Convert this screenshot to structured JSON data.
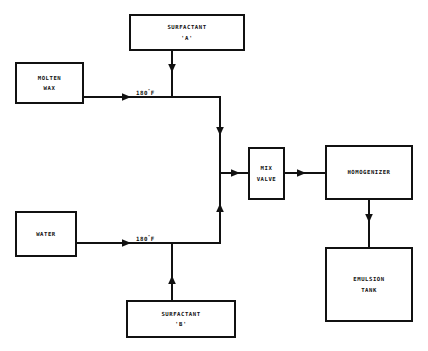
{
  "diagram": {
    "line_color": "#111111",
    "background_color": "#ffffff",
    "nodes": [
      {
        "id": "surfactant_a",
        "label": "SURFACTANT\n'A'"
      },
      {
        "id": "molten_wax",
        "label": "MOLTEN\nWAX"
      },
      {
        "id": "water",
        "label": "WATER"
      },
      {
        "id": "surfactant_b",
        "label": "SURFACTANT\n'B'"
      },
      {
        "id": "mix_valve",
        "label": "MIX\nVALVE"
      },
      {
        "id": "homogenizer",
        "label": "HOMOGENIZER"
      },
      {
        "id": "emulsion_tank",
        "label": "EMULSION\nTANK"
      }
    ],
    "annotations": [
      {
        "id": "temp_top",
        "value": "180",
        "unit": "F",
        "degree": "°"
      },
      {
        "id": "temp_bottom",
        "value": "180",
        "unit": "F",
        "degree": "°"
      }
    ],
    "edges": [
      {
        "from": "surfactant_a",
        "to": "wax_line"
      },
      {
        "from": "molten_wax",
        "to": "riser_top"
      },
      {
        "from": "surfactant_b",
        "to": "water_line"
      },
      {
        "from": "water",
        "to": "riser_bottom"
      },
      {
        "from": "riser",
        "to": "mix_valve"
      },
      {
        "from": "mix_valve",
        "to": "homogenizer"
      },
      {
        "from": "homogenizer",
        "to": "emulsion_tank"
      }
    ]
  }
}
